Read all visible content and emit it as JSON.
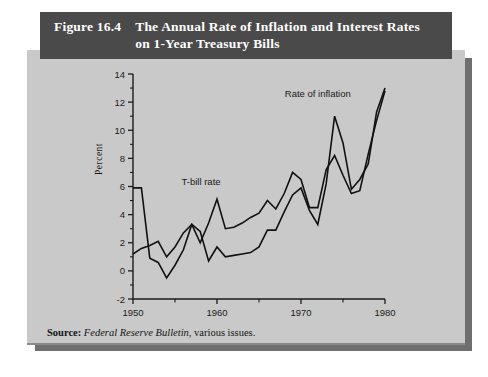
{
  "figure": {
    "number": "Figure 16.4",
    "title_line1": "The Annual Rate of Inflation and Interest Rates",
    "title_line2": "on 1-Year Treasury Bills",
    "source_label": "Source:",
    "source_italic": "Federal Reserve Bulletin",
    "source_rest": ", various issues."
  },
  "colors": {
    "banner_bg": "#4a4a4a",
    "banner_text": "#ffffff",
    "card_bg": "#c9c9c9",
    "shadow": "#6f6f6f",
    "line": "#111111",
    "axis": "#1a1a1a"
  },
  "chart_data": {
    "type": "line",
    "title": "The Annual Rate of Inflation and Interest Rates on 1-Year Treasury Bills",
    "xlabel": "",
    "ylabel": "Percent",
    "xlim": [
      1950,
      1980
    ],
    "ylim": [
      -2,
      14
    ],
    "grid": false,
    "legend": "inline-annotations",
    "x_ticks": [
      1950,
      1960,
      1970,
      1980
    ],
    "x_tick_labels": [
      "1950",
      "1960",
      "1970",
      "1980"
    ],
    "x_minor_ticks": [
      1955,
      1965,
      1975
    ],
    "y_ticks": [
      -2,
      0,
      2,
      4,
      6,
      8,
      10,
      12,
      14
    ],
    "y_tick_labels": [
      "-2",
      "0",
      "2",
      "4",
      "6",
      "8",
      "10",
      "12",
      "14"
    ],
    "y_minor_ticks": [
      -1,
      1,
      3,
      5,
      7,
      9,
      11,
      13
    ],
    "annotations": [
      {
        "text": "Rate of inflation",
        "x": 1972.0,
        "y": 12.4
      },
      {
        "text": "T-bill rate",
        "x": 1958.1,
        "y": 6.1
      }
    ],
    "x": [
      1950,
      1951,
      1952,
      1953,
      1954,
      1955,
      1956,
      1957,
      1958,
      1959,
      1960,
      1961,
      1962,
      1963,
      1964,
      1965,
      1966,
      1967,
      1968,
      1969,
      1970,
      1971,
      1972,
      1973,
      1974,
      1975,
      1976,
      1977,
      1978,
      1979,
      1980
    ],
    "series": [
      {
        "name": "Rate of inflation",
        "values": [
          5.9,
          5.9,
          0.9,
          0.6,
          -0.5,
          0.4,
          1.5,
          3.3,
          2.8,
          0.7,
          1.7,
          1.0,
          1.1,
          1.2,
          1.3,
          1.7,
          2.9,
          2.9,
          4.2,
          5.4,
          5.9,
          4.3,
          3.3,
          6.2,
          11.0,
          9.1,
          5.8,
          6.5,
          7.6,
          11.3,
          13.0
        ]
      },
      {
        "name": "T-bill rate",
        "values": [
          1.2,
          1.6,
          1.8,
          2.1,
          1.0,
          1.7,
          2.7,
          3.3,
          2.0,
          3.4,
          5.1,
          3.0,
          3.1,
          3.4,
          3.8,
          4.1,
          5.0,
          4.4,
          5.5,
          7.0,
          6.5,
          4.5,
          4.5,
          7.2,
          8.2,
          6.8,
          5.5,
          5.7,
          8.3,
          10.7,
          12.8
        ]
      }
    ]
  }
}
